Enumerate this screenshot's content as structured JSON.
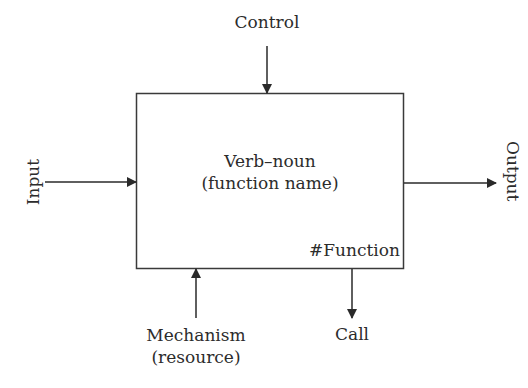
{
  "diagram": {
    "type": "IDEF0 function box",
    "box": {
      "title_line1": "Verb–noun",
      "title_line2": "(function name)",
      "id_label": "#Function"
    },
    "arrows": {
      "control": {
        "label": "Control",
        "direction": "down",
        "side": "top"
      },
      "input": {
        "label": "Input",
        "direction": "right",
        "side": "left"
      },
      "output": {
        "label": "Output",
        "direction": "right",
        "side": "right"
      },
      "mechanism": {
        "label_line1": "Mechanism",
        "label_line2": "(resource)",
        "direction": "up",
        "side": "bottom"
      },
      "call": {
        "label": "Call",
        "direction": "down",
        "side": "bottom"
      }
    },
    "colors": {
      "line": "#333333",
      "text": "#2c2c2c",
      "background": "#ffffff"
    }
  }
}
